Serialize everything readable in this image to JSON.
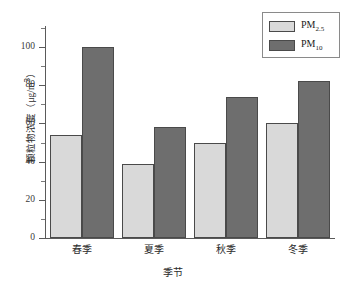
{
  "chart_data": {
    "type": "bar",
    "title": "",
    "xlabel": "季节",
    "ylabel": "颗粒物浓度（μg/m³）",
    "ylabel_main": "颗粒物浓度（",
    "ylabel_unit": "μg/m",
    "ylabel_sup": "3",
    "ylabel_close": "）",
    "categories": [
      "春季",
      "夏季",
      "秋季",
      "冬季"
    ],
    "series": [
      {
        "name": "PM2.5",
        "label_base": "PM",
        "label_sub": "2.5",
        "values": [
          54,
          39,
          50,
          60
        ],
        "color": "#d9d9d9"
      },
      {
        "name": "PM10",
        "label_base": "PM",
        "label_sub": "10",
        "values": [
          100,
          58,
          74,
          82
        ],
        "color": "#6e6e6e"
      }
    ],
    "ylim": [
      0,
      110
    ],
    "yticks": [
      0,
      20,
      40,
      60,
      80,
      100
    ],
    "ytick_labels": [
      "0",
      "20",
      "40",
      "60",
      "80",
      "100"
    ],
    "yminor_ticks": [
      10,
      30,
      50,
      70,
      90,
      110
    ],
    "grid": false,
    "legend_position": "top-right",
    "axis_color": "#5a5a5a",
    "bar_edge_color": "#4a4a4a",
    "background": "#ffffff"
  }
}
